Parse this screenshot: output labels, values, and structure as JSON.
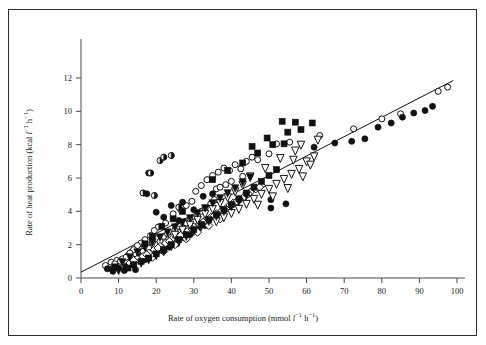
{
  "figure": {
    "background_color": "#ffffff",
    "border_color": "#2b2b2b",
    "axis_color": "#4a4a4a",
    "marker_color": "#111111"
  },
  "chart_data": {
    "type": "scatter",
    "title": "",
    "xlabel": "Rate of oxygen consumption (mmol l⁻¹ h⁻¹)",
    "ylabel": "Rate of heat production (kcal l⁻¹ h⁻¹)",
    "xlabel_parts": {
      "prefix": "Rate of oxygen consumption (mmol ",
      "unit1": "l",
      "exp1": "−1",
      "unit2": " h",
      "exp2": "−1",
      "suffix": ")"
    },
    "ylabel_parts": {
      "prefix": "Rate of heat production (kcal ",
      "unit1": "l",
      "exp1": "−1",
      "unit2": " h",
      "exp2": "−1",
      "suffix": ")"
    },
    "xlim": [
      0,
      100
    ],
    "ylim": [
      0,
      13.2
    ],
    "xticks": [
      0,
      10,
      20,
      30,
      40,
      50,
      60,
      70,
      80,
      90,
      100
    ],
    "yticks": [
      0,
      2,
      4,
      6,
      8,
      10,
      12
    ],
    "xtick_labels": [
      "0",
      "10",
      "20",
      "30",
      "40",
      "50",
      "60",
      "70",
      "80",
      "90",
      "100"
    ],
    "ytick_labels": [
      "0",
      "2",
      "4",
      "6",
      "8",
      "10",
      "12"
    ],
    "grid": false,
    "legend": "none",
    "tick_direction": "out",
    "fit_line": {
      "name": "regression line",
      "x_start": 0.0,
      "y_start": 0.35,
      "x_end": 99.0,
      "y_end": 11.85
    },
    "series": [
      {
        "name": "open circle",
        "marker": "open-circle",
        "points": [
          [
            6.5,
            0.75
          ],
          [
            8.0,
            0.95
          ],
          [
            9.5,
            1.05
          ],
          [
            11.0,
            1.15
          ],
          [
            12.5,
            1.35
          ],
          [
            13.5,
            1.55
          ],
          [
            14.5,
            1.45
          ],
          [
            15.5,
            1.75
          ],
          [
            16.5,
            1.6
          ],
          [
            17.5,
            2.0
          ],
          [
            18.0,
            1.8
          ],
          [
            19.0,
            2.15
          ],
          [
            20.0,
            2.35
          ],
          [
            21.0,
            2.2
          ],
          [
            22.0,
            2.5
          ],
          [
            23.0,
            2.65
          ],
          [
            24.0,
            2.45
          ],
          [
            25.0,
            2.9
          ],
          [
            26.0,
            3.1
          ],
          [
            27.0,
            2.95
          ],
          [
            28.0,
            3.3
          ],
          [
            29.0,
            3.5
          ],
          [
            30.0,
            3.35
          ],
          [
            31.0,
            3.7
          ],
          [
            32.0,
            4.0
          ],
          [
            33.0,
            4.2
          ],
          [
            34.5,
            4.45
          ],
          [
            35.5,
            4.7
          ],
          [
            30.5,
            5.2
          ],
          [
            32.0,
            5.55
          ],
          [
            33.5,
            5.9
          ],
          [
            35.0,
            6.15
          ],
          [
            36.5,
            6.35
          ],
          [
            38.0,
            6.6
          ],
          [
            39.5,
            6.45
          ],
          [
            41.0,
            6.8
          ],
          [
            42.5,
            6.55
          ],
          [
            44.0,
            7.0
          ],
          [
            45.5,
            7.25
          ],
          [
            36.0,
            5.35
          ],
          [
            29.5,
            4.6
          ],
          [
            28.0,
            4.35
          ],
          [
            26.5,
            4.1
          ],
          [
            24.5,
            3.85
          ],
          [
            22.5,
            3.3
          ],
          [
            20.5,
            3.05
          ],
          [
            19.5,
            2.85
          ],
          [
            18.5,
            2.55
          ],
          [
            17.0,
            2.3
          ],
          [
            16.0,
            2.1
          ],
          [
            15.0,
            1.95
          ],
          [
            14.0,
            1.7
          ],
          [
            13.0,
            1.5
          ],
          [
            12.0,
            1.25
          ],
          [
            10.5,
            1.0
          ],
          [
            9.0,
            0.85
          ],
          [
            43.0,
            6.1
          ],
          [
            40.0,
            5.8
          ],
          [
            38.5,
            5.6
          ],
          [
            37.0,
            5.45
          ],
          [
            50.0,
            7.45
          ],
          [
            47.0,
            7.1
          ],
          [
            52.0,
            8.05
          ],
          [
            55.5,
            8.15
          ],
          [
            63.5,
            8.55
          ],
          [
            72.5,
            8.95
          ],
          [
            95.0,
            11.2
          ],
          [
            97.5,
            11.45
          ],
          [
            85.0,
            9.85
          ],
          [
            80.0,
            9.55
          ]
        ]
      },
      {
        "name": "filled circle",
        "marker": "filled-circle",
        "points": [
          [
            7.0,
            0.55
          ],
          [
            10.0,
            0.6
          ],
          [
            12.0,
            0.7
          ],
          [
            13.5,
            0.85
          ],
          [
            16.0,
            1.3
          ],
          [
            17.0,
            1.1
          ],
          [
            18.5,
            1.25
          ],
          [
            19.5,
            1.4
          ],
          [
            21.5,
            1.65
          ],
          [
            23.5,
            1.85
          ],
          [
            25.5,
            2.05
          ],
          [
            27.5,
            2.4
          ],
          [
            29.0,
            2.6
          ],
          [
            31.0,
            2.85
          ],
          [
            33.0,
            3.15
          ],
          [
            34.0,
            3.45
          ],
          [
            30.0,
            4.1
          ],
          [
            27.0,
            4.55
          ],
          [
            32.5,
            4.9
          ],
          [
            35.0,
            5.05
          ],
          [
            24.0,
            4.35
          ],
          [
            20.0,
            3.95
          ],
          [
            22.0,
            3.65
          ],
          [
            26.0,
            3.45
          ],
          [
            50.5,
            4.2
          ],
          [
            50.5,
            4.7
          ],
          [
            54.5,
            4.45
          ],
          [
            72.0,
            8.2
          ],
          [
            75.5,
            8.35
          ],
          [
            79.0,
            9.05
          ],
          [
            82.5,
            9.3
          ],
          [
            85.5,
            9.65
          ],
          [
            88.5,
            9.9
          ],
          [
            91.5,
            10.05
          ],
          [
            93.5,
            10.3
          ],
          [
            67.5,
            8.1
          ],
          [
            62.0,
            7.85
          ],
          [
            18.0,
            6.3
          ],
          [
            17.5,
            5.05
          ],
          [
            14.5,
            0.5
          ],
          [
            11.5,
            0.45
          ],
          [
            8.5,
            0.4
          ]
        ]
      },
      {
        "name": "half filled circle",
        "marker": "half-circle",
        "points": [
          [
            18.5,
            6.3
          ],
          [
            21.0,
            7.05
          ],
          [
            22.0,
            7.25
          ],
          [
            24.0,
            7.35
          ],
          [
            16.5,
            5.1
          ],
          [
            19.5,
            4.95
          ],
          [
            26.0,
            4.25
          ]
        ]
      },
      {
        "name": "open diamond",
        "marker": "open-diamond",
        "points": [
          [
            13.0,
            0.9
          ],
          [
            15.0,
            1.15
          ],
          [
            16.5,
            1.3
          ],
          [
            18.0,
            1.5
          ],
          [
            19.5,
            1.7
          ],
          [
            21.0,
            1.9
          ],
          [
            22.5,
            2.1
          ],
          [
            24.0,
            2.3
          ],
          [
            25.5,
            2.45
          ],
          [
            27.0,
            2.65
          ],
          [
            28.5,
            2.85
          ],
          [
            30.0,
            3.05
          ],
          [
            31.5,
            3.25
          ],
          [
            33.0,
            3.45
          ],
          [
            34.5,
            3.65
          ],
          [
            36.0,
            3.85
          ],
          [
            37.5,
            4.05
          ],
          [
            39.0,
            4.25
          ],
          [
            40.5,
            4.5
          ],
          [
            42.0,
            4.7
          ],
          [
            43.5,
            4.9
          ],
          [
            45.0,
            5.15
          ],
          [
            46.5,
            5.35
          ],
          [
            48.0,
            5.55
          ],
          [
            14.0,
            1.05
          ],
          [
            17.5,
            1.4
          ],
          [
            20.5,
            1.8
          ],
          [
            23.5,
            2.2
          ],
          [
            26.5,
            2.55
          ],
          [
            29.5,
            2.95
          ],
          [
            32.5,
            3.35
          ],
          [
            35.5,
            3.75
          ],
          [
            38.5,
            4.15
          ],
          [
            41.5,
            4.6
          ],
          [
            44.5,
            5.05
          ],
          [
            47.5,
            5.45
          ],
          [
            28.0,
            2.35
          ],
          [
            31.0,
            2.75
          ],
          [
            34.0,
            3.15
          ],
          [
            37.0,
            3.55
          ],
          [
            25.0,
            2.0
          ],
          [
            22.0,
            1.6
          ],
          [
            19.0,
            1.25
          ]
        ]
      },
      {
        "name": "open triangle down",
        "marker": "open-triangle",
        "points": [
          [
            36.0,
            3.4
          ],
          [
            38.0,
            3.65
          ],
          [
            40.0,
            3.9
          ],
          [
            42.0,
            4.15
          ],
          [
            44.0,
            4.45
          ],
          [
            46.0,
            4.75
          ],
          [
            48.0,
            5.05
          ],
          [
            50.0,
            5.35
          ],
          [
            52.0,
            5.65
          ],
          [
            54.0,
            5.95
          ],
          [
            56.0,
            6.25
          ],
          [
            58.0,
            6.55
          ],
          [
            60.0,
            7.0
          ],
          [
            62.0,
            7.3
          ],
          [
            57.0,
            7.65
          ],
          [
            53.0,
            7.2
          ],
          [
            49.0,
            6.6
          ],
          [
            45.0,
            6.1
          ],
          [
            43.0,
            5.6
          ],
          [
            41.0,
            5.2
          ],
          [
            39.0,
            4.85
          ],
          [
            37.0,
            4.5
          ],
          [
            35.0,
            4.15
          ],
          [
            33.0,
            3.85
          ],
          [
            31.0,
            3.5
          ],
          [
            29.0,
            3.2
          ],
          [
            27.0,
            2.9
          ],
          [
            25.0,
            2.6
          ],
          [
            51.0,
            4.9
          ],
          [
            55.0,
            5.4
          ],
          [
            59.0,
            6.1
          ],
          [
            61.0,
            6.8
          ],
          [
            56.5,
            7.1
          ],
          [
            58.5,
            8.0
          ],
          [
            63.0,
            8.3
          ],
          [
            47.0,
            4.4
          ]
        ]
      },
      {
        "name": "filled triangle down",
        "marker": "filled-triangle",
        "points": [
          [
            10.0,
            0.45
          ],
          [
            12.0,
            0.55
          ],
          [
            14.0,
            0.7
          ],
          [
            16.0,
            0.9
          ],
          [
            18.0,
            1.1
          ],
          [
            20.0,
            1.35
          ],
          [
            22.0,
            1.6
          ],
          [
            24.0,
            1.9
          ],
          [
            26.0,
            2.2
          ],
          [
            28.0,
            2.5
          ],
          [
            30.0,
            2.8
          ],
          [
            32.0,
            3.1
          ],
          [
            34.0,
            3.4
          ],
          [
            36.0,
            3.7
          ],
          [
            38.0,
            4.0
          ],
          [
            40.0,
            4.3
          ],
          [
            42.0,
            4.6
          ],
          [
            44.0,
            4.95
          ],
          [
            25.0,
            3.05
          ],
          [
            27.0,
            3.35
          ],
          [
            29.0,
            3.6
          ],
          [
            31.0,
            3.9
          ],
          [
            33.0,
            4.2
          ],
          [
            35.0,
            4.5
          ],
          [
            37.0,
            4.8
          ],
          [
            39.0,
            5.1
          ],
          [
            41.0,
            5.4
          ],
          [
            43.0,
            5.75
          ],
          [
            45.0,
            6.05
          ],
          [
            23.0,
            2.75
          ],
          [
            21.0,
            2.45
          ],
          [
            19.0,
            2.15
          ],
          [
            17.0,
            1.85
          ],
          [
            15.0,
            1.55
          ],
          [
            13.0,
            1.25
          ],
          [
            11.0,
            0.95
          ],
          [
            9.0,
            0.65
          ],
          [
            8.0,
            0.5
          ]
        ]
      },
      {
        "name": "filled square",
        "marker": "filled-square",
        "points": [
          [
            16.0,
            1.0
          ],
          [
            18.0,
            1.2
          ],
          [
            20.0,
            1.45
          ],
          [
            22.0,
            1.7
          ],
          [
            24.0,
            2.0
          ],
          [
            26.0,
            2.3
          ],
          [
            28.0,
            2.6
          ],
          [
            30.0,
            2.9
          ],
          [
            32.0,
            3.2
          ],
          [
            34.0,
            3.5
          ],
          [
            36.0,
            3.8
          ],
          [
            38.0,
            4.1
          ],
          [
            40.0,
            4.4
          ],
          [
            42.0,
            4.75
          ],
          [
            44.0,
            5.1
          ],
          [
            46.0,
            5.45
          ],
          [
            48.0,
            5.8
          ],
          [
            50.0,
            6.15
          ],
          [
            52.0,
            6.5
          ],
          [
            35.0,
            5.9
          ],
          [
            39.0,
            6.45
          ],
          [
            43.0,
            6.9
          ],
          [
            47.0,
            7.5
          ],
          [
            51.0,
            8.0
          ],
          [
            53.5,
            9.4
          ],
          [
            57.0,
            9.35
          ],
          [
            61.5,
            9.3
          ],
          [
            55.0,
            8.75
          ],
          [
            58.5,
            8.9
          ],
          [
            49.5,
            8.4
          ],
          [
            54.0,
            8.05
          ],
          [
            45.5,
            7.9
          ],
          [
            27.0,
            4.0
          ],
          [
            24.5,
            3.55
          ],
          [
            21.5,
            3.1
          ],
          [
            19.0,
            2.5
          ],
          [
            17.0,
            2.05
          ],
          [
            14.0,
            0.8
          ],
          [
            12.5,
            0.6
          ]
        ]
      }
    ]
  }
}
